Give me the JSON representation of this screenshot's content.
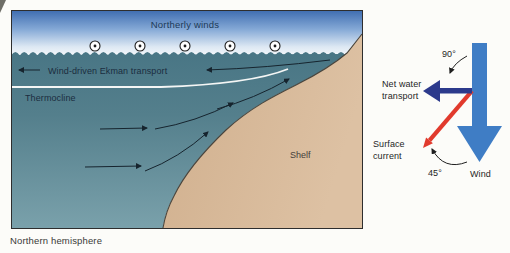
{
  "figure": {
    "caption": "Northern hemisphere",
    "cross_section": {
      "wind_label": "Northerly winds",
      "ekman_label": "Wind-driven Ekman transport",
      "thermocline_label": "Thermocline",
      "shelf_label": "Shelf",
      "wind_symbol": "circled-dot-wind-out-of-page",
      "wind_symbol_count": 5
    },
    "vector_panel": {
      "angle_between_wind_and_transport": "90°",
      "angle_between_wind_and_current": "45°",
      "net_transport_label": [
        "Net water",
        "transport"
      ],
      "surface_current_label": [
        "Surface",
        "current"
      ],
      "wind_label": "Wind"
    },
    "colors": {
      "wind_arrow": "#3f7dc5",
      "net_transport_arrow": "#2c3a8c",
      "surface_current_arrow": "#e13a2d",
      "sky_top": "#3d6cb0",
      "water_top": "#497685",
      "water_bottom": "#7aa1ab",
      "shelf": "#d6b795"
    }
  }
}
